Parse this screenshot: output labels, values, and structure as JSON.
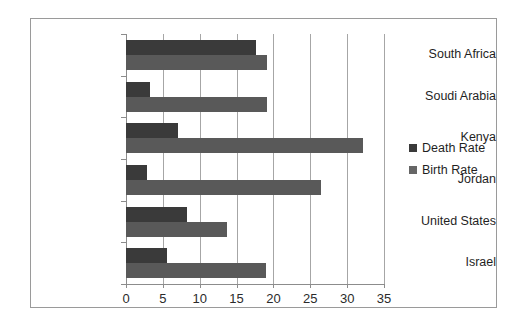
{
  "chart_data": {
    "type": "bar",
    "orientation": "horizontal",
    "title": "",
    "xlabel": "",
    "ylabel": "",
    "xlim": [
      0,
      35
    ],
    "xticks": [
      0,
      5,
      10,
      15,
      20,
      25,
      30,
      35
    ],
    "grid": true,
    "legend_position": "right",
    "categories": [
      "South Africa",
      "Soudi Arabia",
      "Kenya",
      "Jordan",
      "United States",
      "Israel"
    ],
    "series": [
      {
        "name": "Death Rate",
        "color": "#3a3a3a",
        "values": [
          17.6,
          3.2,
          7.1,
          2.8,
          8.3,
          5.5
        ]
      },
      {
        "name": "Birth Rate",
        "color": "#595959",
        "values": [
          19.1,
          19.1,
          32.1,
          26.5,
          13.7,
          19.0
        ]
      }
    ]
  },
  "legend": {
    "items": [
      {
        "label": "Death Rate",
        "color": "#3a3a3a"
      },
      {
        "label": "Birth Rate",
        "color": "#666666"
      }
    ]
  }
}
